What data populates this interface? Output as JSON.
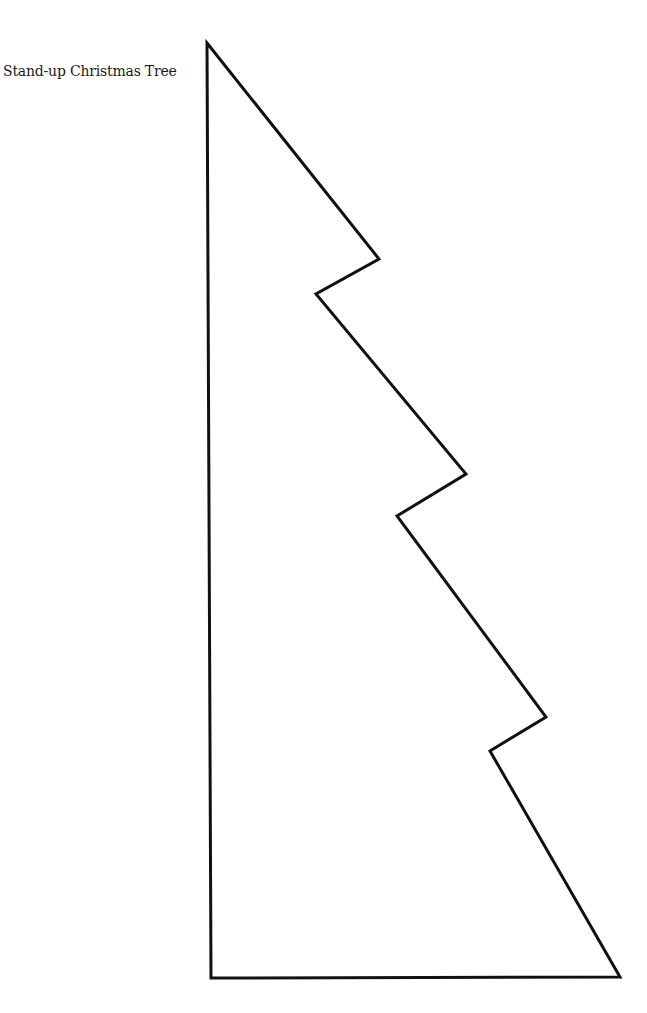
{
  "document": {
    "title": "Stand-up Christmas Tree"
  },
  "tree_outline": {
    "stroke_color": "#111111",
    "stroke_width": 3,
    "fill_color": "#ffffff",
    "points": "207,43 379,259 316,294 466,474 397,516 546,717 490,751 620,977 211,978"
  }
}
